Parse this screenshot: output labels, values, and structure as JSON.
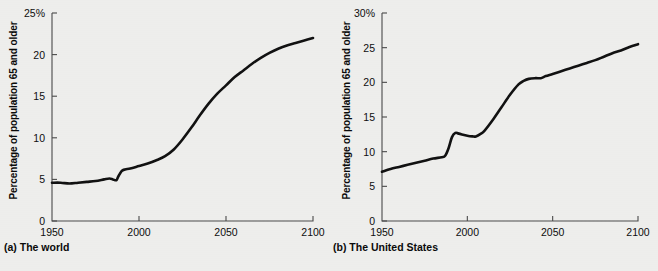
{
  "figure": {
    "background_color": "#eeeeec",
    "curve_color": "#111111",
    "axis_color": "#4a4a4a"
  },
  "panels": [
    {
      "caption": "(a) The world",
      "ylabel": "Percentage of population 65 and older",
      "ytop_label": "25%"
    },
    {
      "caption": "(b) The United States",
      "ylabel": "Percentage of population 65 and older",
      "ytop_label": "30%"
    }
  ],
  "chart_data": [
    {
      "type": "line",
      "title": "(a) The world",
      "xlabel": "",
      "ylabel": "Percentage of population 65 and older",
      "xlim": [
        1950,
        2100
      ],
      "ylim": [
        0,
        25
      ],
      "xticks": [
        1950,
        2000,
        2050,
        2100
      ],
      "xticklabels": [
        "1950",
        "2000",
        "2050",
        "2100"
      ],
      "yticks": [
        0,
        5,
        10,
        15,
        20,
        25
      ],
      "yticklabels": [
        "0",
        "5",
        "10",
        "15",
        "20",
        "25%"
      ],
      "grid": false,
      "legend": null,
      "series": [
        {
          "name": "World population 65 and older",
          "x": [
            1950,
            1955,
            1960,
            1965,
            1970,
            1975,
            1980,
            1983,
            1985,
            1987,
            1988,
            1990,
            1992,
            1995,
            2000,
            2005,
            2010,
            2015,
            2020,
            2025,
            2030,
            2035,
            2040,
            2045,
            2050,
            2055,
            2060,
            2065,
            2070,
            2075,
            2080,
            2085,
            2090,
            2095,
            2100
          ],
          "y": [
            4.6,
            4.6,
            4.5,
            4.6,
            4.7,
            4.8,
            5.0,
            5.1,
            5.0,
            4.9,
            5.3,
            6.0,
            6.2,
            6.3,
            6.6,
            6.9,
            7.3,
            7.8,
            8.6,
            9.8,
            11.2,
            12.7,
            14.1,
            15.3,
            16.3,
            17.3,
            18.1,
            18.9,
            19.6,
            20.2,
            20.7,
            21.1,
            21.4,
            21.7,
            22.0
          ]
        }
      ]
    },
    {
      "type": "line",
      "title": "(b) The United States",
      "xlabel": "",
      "ylabel": "Percentage of population 65 and older",
      "xlim": [
        1950,
        2100
      ],
      "ylim": [
        0,
        30
      ],
      "xticks": [
        1950,
        2000,
        2050,
        2100
      ],
      "xticklabels": [
        "1950",
        "2000",
        "2050",
        "2100"
      ],
      "yticks": [
        0,
        5,
        10,
        15,
        20,
        25,
        30
      ],
      "yticklabels": [
        "0",
        "5",
        "10",
        "15",
        "20",
        "25",
        "30%"
      ],
      "grid": false,
      "legend": null,
      "series": [
        {
          "name": "United States population 65 and older",
          "x": [
            1950,
            1955,
            1960,
            1965,
            1970,
            1975,
            1980,
            1985,
            1987,
            1989,
            1991,
            1993,
            1995,
            2000,
            2003,
            2005,
            2008,
            2010,
            2015,
            2020,
            2025,
            2030,
            2033,
            2036,
            2040,
            2043,
            2046,
            2050,
            2055,
            2060,
            2065,
            2070,
            2075,
            2080,
            2085,
            2090,
            2095,
            2100
          ],
          "y": [
            7.1,
            7.5,
            7.8,
            8.1,
            8.4,
            8.7,
            9.0,
            9.2,
            9.4,
            10.5,
            12.1,
            12.7,
            12.6,
            12.3,
            12.2,
            12.2,
            12.6,
            13.0,
            14.6,
            16.4,
            18.2,
            19.7,
            20.2,
            20.5,
            20.6,
            20.6,
            20.9,
            21.2,
            21.6,
            22.0,
            22.4,
            22.8,
            23.2,
            23.7,
            24.2,
            24.6,
            25.1,
            25.5
          ]
        }
      ]
    }
  ]
}
